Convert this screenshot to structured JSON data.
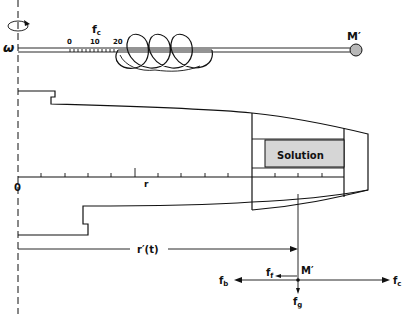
{
  "figure": {
    "type": "ultracentrifuge schematic with spring balance analogy and force diagram",
    "colors": {
      "line": "#111111",
      "background": "#ffffff",
      "mass_fill": "#b8b8b8",
      "solution_fill": "#d6d6d6"
    }
  },
  "spring_balance": {
    "omega_label": "ω",
    "force_label": "f",
    "force_sub": "c",
    "scale_ticks": [
      "0",
      "10",
      "20"
    ],
    "mass_label": "M′"
  },
  "rotor": {
    "origin_label": "0",
    "axis_label": "r",
    "cell_label": "Solution",
    "radius_label": "r′(t)"
  },
  "force_diagram": {
    "mass_label": "M′",
    "forces": [
      {
        "name": "f",
        "sub": "b",
        "direction": "left"
      },
      {
        "name": "f",
        "sub": "f",
        "direction": "left"
      },
      {
        "name": "f",
        "sub": "c",
        "direction": "right"
      },
      {
        "name": "f",
        "sub": "g",
        "direction": "down"
      }
    ]
  }
}
